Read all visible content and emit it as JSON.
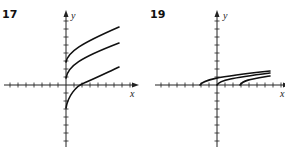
{
  "graphs": [
    {
      "number": "17",
      "x_label": "x",
      "y_label": "y",
      "origin": [
        66,
        85
      ],
      "tick_spacing": 8,
      "x_ticks_left": 7,
      "x_ticks_right": 8,
      "y_ticks_up": 8,
      "y_ticks_down": 7,
      "curves": [
        "M66,62 C68,52 80,44 119,27",
        "M66,78 C68,66 80,58 119,43",
        "M66,108 C68,96 76,86 84,83 C96,78 106,73 119,67"
      ]
    },
    {
      "number": "19",
      "x_label": "x",
      "y_label": "y",
      "origin": [
        217,
        85
      ],
      "tick_spacing": 8,
      "x_ticks_left": 7,
      "x_ticks_right": 8,
      "y_ticks_up": 8,
      "y_ticks_down": 7,
      "curves": [
        "M200,85 C203,80 215,77 270,71",
        "M217,85 C220,80 232,78 270,73",
        "M240,85 C243,80 252,79 270,76"
      ]
    }
  ]
}
